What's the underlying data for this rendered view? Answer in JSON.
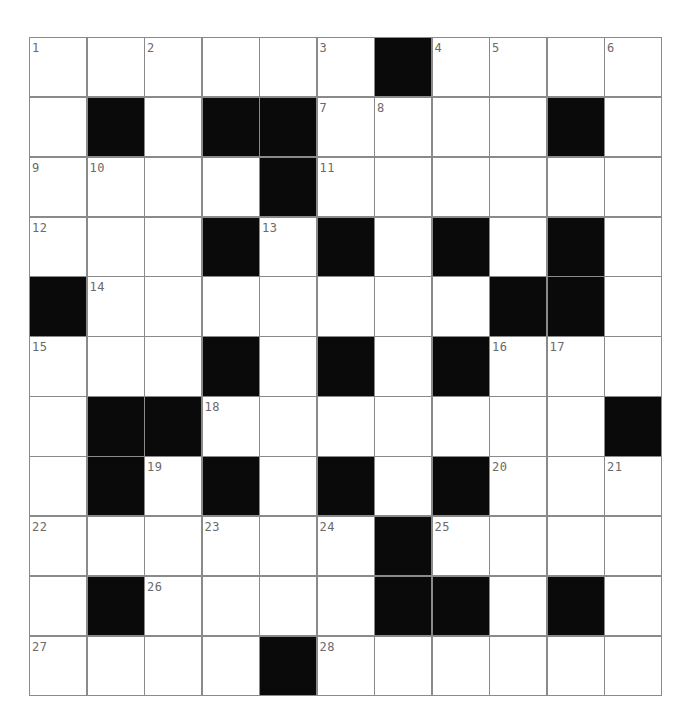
{
  "puzzle": {
    "rows": 11,
    "cols": 11,
    "colors": {
      "block": "#0a0a0a",
      "cell": "#ffffff",
      "gridline": "#8a8a8a",
      "number": "#6a6a6a"
    },
    "grid": [
      [
        "1",
        ".",
        "2",
        ".",
        ".",
        "3",
        "#",
        "4",
        "5",
        ".",
        "6"
      ],
      [
        ".",
        "#",
        ".",
        "#",
        "#",
        "7",
        "8",
        ".",
        ".",
        "#",
        "."
      ],
      [
        "9",
        "10",
        ".",
        ".",
        "#",
        "11",
        ".",
        ".",
        ".",
        ".",
        "."
      ],
      [
        "12",
        ".",
        ".",
        "#",
        "13",
        "#",
        ".",
        "#",
        ".",
        "#",
        "."
      ],
      [
        "#",
        "14",
        ".",
        ".",
        ".",
        ".",
        ".",
        ".",
        "#",
        "#",
        "."
      ],
      [
        "15",
        ".",
        ".",
        "#",
        ".",
        "#",
        ".",
        "#",
        "16",
        "17",
        "."
      ],
      [
        ".",
        "#",
        "#",
        "18",
        ".",
        ".",
        ".",
        ".",
        ".",
        ".",
        "#"
      ],
      [
        ".",
        "#",
        "19",
        "#",
        ".",
        "#",
        ".",
        "#",
        "20",
        ".",
        "21"
      ],
      [
        "22",
        ".",
        ".",
        "23",
        ".",
        "24",
        "#",
        "25",
        ".",
        ".",
        "."
      ],
      [
        ".",
        "#",
        "26",
        ".",
        ".",
        ".",
        "#",
        "#",
        ".",
        "#",
        "."
      ],
      [
        "27",
        ".",
        ".",
        ".",
        "#",
        "28",
        ".",
        ".",
        ".",
        ".",
        "."
      ]
    ],
    "across_numbers": [
      1,
      4,
      7,
      9,
      11,
      12,
      14,
      15,
      16,
      18,
      20,
      22,
      25,
      26,
      27,
      28
    ],
    "down_numbers": [
      1,
      2,
      3,
      5,
      6,
      8,
      10,
      13,
      15,
      17,
      19,
      21,
      23,
      24
    ]
  }
}
